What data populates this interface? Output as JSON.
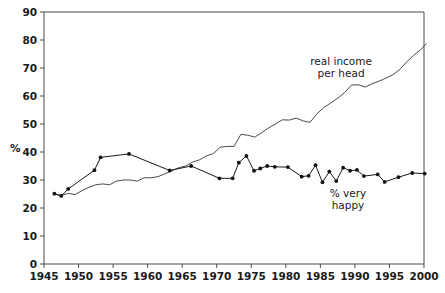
{
  "chart_data": {
    "type": "line",
    "title": "",
    "xlabel": "",
    "ylabel": "%",
    "xlim": [
      1945,
      2000
    ],
    "ylim": [
      0,
      90
    ],
    "ytick_step": 10,
    "xtick_step": 5,
    "grid": false,
    "legend": "inline-annotations",
    "xticks": [
      "1945",
      "1950",
      "1955",
      "1960",
      "1965",
      "1970",
      "1975",
      "1980",
      "1985",
      "1990",
      "1995",
      "2000"
    ],
    "yticks": [
      "0",
      "10",
      "20",
      "30",
      "40",
      "50",
      "60",
      "70",
      "80",
      "90"
    ],
    "annotations": [
      {
        "text": "real income per head",
        "line1": "real income",
        "line2": "per head",
        "x": 1988,
        "y": 71
      },
      {
        "text": "% very happy",
        "line1": "% very",
        "line2": "happy",
        "x": 1989,
        "y": 24
      }
    ],
    "series": [
      {
        "name": "real income per head",
        "markers": false,
        "points": [
          [
            1946.5,
            25.0
          ],
          [
            1947.5,
            24.5
          ],
          [
            1948.5,
            25.2
          ],
          [
            1949.5,
            24.8
          ],
          [
            1950.5,
            26.2
          ],
          [
            1951.5,
            27.4
          ],
          [
            1952.5,
            28.3
          ],
          [
            1953.5,
            28.6
          ],
          [
            1954.5,
            28.3
          ],
          [
            1955.5,
            29.6
          ],
          [
            1956.5,
            30.0
          ],
          [
            1957.5,
            30.0
          ],
          [
            1958.5,
            29.6
          ],
          [
            1959.5,
            30.8
          ],
          [
            1960.5,
            30.8
          ],
          [
            1961.5,
            31.2
          ],
          [
            1962.5,
            32.2
          ],
          [
            1963.5,
            33.3
          ],
          [
            1964.5,
            34.4
          ],
          [
            1965.5,
            35.0
          ],
          [
            1966.5,
            36.4
          ],
          [
            1967.5,
            37.2
          ],
          [
            1968.5,
            38.6
          ],
          [
            1969.5,
            39.4
          ],
          [
            1970.5,
            41.7
          ],
          [
            1971.5,
            42.0
          ],
          [
            1972.5,
            42.0
          ],
          [
            1973.5,
            46.3
          ],
          [
            1974.5,
            46.0
          ],
          [
            1975.5,
            45.3
          ],
          [
            1976.5,
            46.9
          ],
          [
            1977.5,
            48.6
          ],
          [
            1978.5,
            50.0
          ],
          [
            1979.5,
            51.5
          ],
          [
            1980.5,
            51.4
          ],
          [
            1981.5,
            52.1
          ],
          [
            1982.5,
            51.1
          ],
          [
            1983.5,
            50.6
          ],
          [
            1984.5,
            53.6
          ],
          [
            1985.5,
            55.9
          ],
          [
            1986.5,
            57.5
          ],
          [
            1987.5,
            59.2
          ],
          [
            1988.5,
            61.2
          ],
          [
            1989.5,
            63.9
          ],
          [
            1990.5,
            64.0
          ],
          [
            1991.5,
            63.2
          ],
          [
            1992.5,
            64.4
          ],
          [
            1993.5,
            65.3
          ],
          [
            1994.5,
            66.4
          ],
          [
            1995.5,
            67.6
          ],
          [
            1996.5,
            69.5
          ],
          [
            1997.5,
            72.2
          ],
          [
            1998.5,
            74.5
          ],
          [
            1999.5,
            76.5
          ],
          [
            2000.3,
            78.6
          ]
        ]
      },
      {
        "name": "% very happy",
        "markers": true,
        "points": [
          [
            1946.5,
            25.1
          ],
          [
            1947.5,
            24.3
          ],
          [
            1948.5,
            26.8
          ],
          [
            1952.3,
            33.5
          ],
          [
            1953.2,
            38.1
          ],
          [
            1957.3,
            39.3
          ],
          [
            1963.2,
            33.4
          ],
          [
            1966.3,
            35.0
          ],
          [
            1970.4,
            30.6
          ],
          [
            1972.3,
            30.6
          ],
          [
            1973.2,
            36.2
          ],
          [
            1974.3,
            38.6
          ],
          [
            1975.4,
            33.3
          ],
          [
            1976.3,
            34.1
          ],
          [
            1977.3,
            35.0
          ],
          [
            1978.4,
            34.7
          ],
          [
            1980.3,
            34.6
          ],
          [
            1982.3,
            31.2
          ],
          [
            1983.3,
            31.5
          ],
          [
            1984.3,
            35.3
          ],
          [
            1985.3,
            29.2
          ],
          [
            1986.3,
            33.0
          ],
          [
            1987.3,
            29.6
          ],
          [
            1988.3,
            34.4
          ],
          [
            1989.3,
            33.3
          ],
          [
            1990.3,
            33.6
          ],
          [
            1991.3,
            31.4
          ],
          [
            1993.3,
            32.0
          ],
          [
            1994.3,
            29.3
          ],
          [
            1996.3,
            31.0
          ],
          [
            1998.3,
            32.5
          ],
          [
            2000.1,
            32.3
          ]
        ]
      }
    ]
  }
}
